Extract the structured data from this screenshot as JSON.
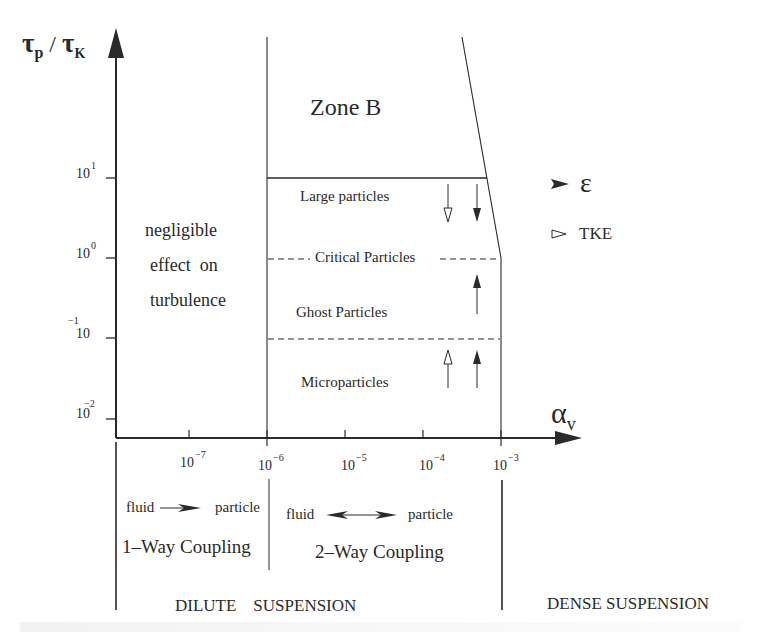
{
  "axes": {
    "y_label_main": "τ",
    "y_label_sub1": "p",
    "y_label_sep": " / ",
    "y_label_main2": "τ",
    "y_label_sub2": "K",
    "x_label_main": "α",
    "x_label_sub": "v",
    "y_ticks": [
      {
        "base": "10",
        "exp": "1"
      },
      {
        "base": "10",
        "exp": "0"
      },
      {
        "base": "10",
        "exp": "−1"
      },
      {
        "base": "10",
        "exp": "−2"
      }
    ],
    "x_ticks": [
      {
        "base": "10",
        "exp": "−7"
      },
      {
        "base": "10",
        "exp": "−6"
      },
      {
        "base": "10",
        "exp": "−5"
      },
      {
        "base": "10",
        "exp": "−4"
      },
      {
        "base": "10",
        "exp": "−3"
      }
    ]
  },
  "regions": {
    "zone_b": "Zone B",
    "negligible_line1": "negligible",
    "negligible_line2": "effect  on",
    "negligible_line3": "turbulence",
    "large": "Large particles",
    "critical": "Critical Particles",
    "ghost": "Ghost Particles",
    "micro": "Microparticles"
  },
  "legend": {
    "epsilon_symbol": "ε",
    "tke_label": "TKE"
  },
  "coupling": {
    "one_way_from": "fluid",
    "one_way_to": "particle",
    "one_way_label": "1–Way Coupling",
    "two_way_from": "fluid",
    "two_way_to": "particle",
    "two_way_label": "2–Way Coupling"
  },
  "suspension": {
    "dilute": "DILUTE    SUSPENSION",
    "dense": "DENSE SUSPENSION"
  },
  "colors": {
    "ink": "#2a2a2a",
    "background": "#ffffff"
  }
}
